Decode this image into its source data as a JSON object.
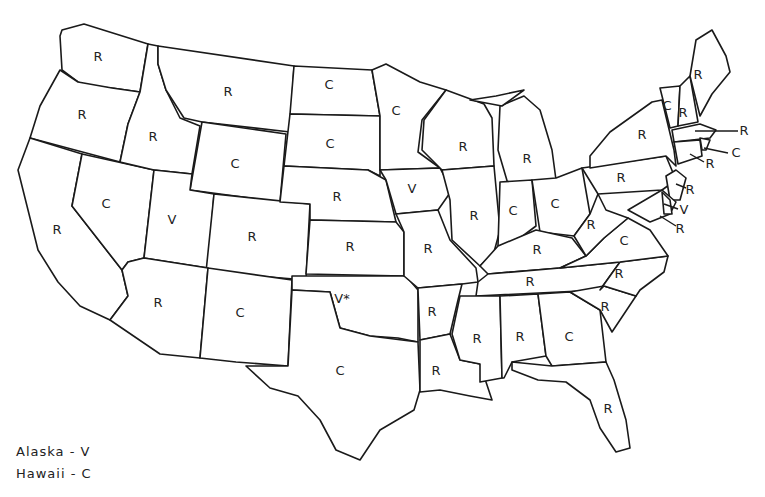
{
  "map": {
    "description": "US state outline map with single-letter codes per state",
    "codes_legend": [
      "R",
      "C",
      "V"
    ],
    "oklahoma_footnote_marker": "*"
  },
  "states": [
    {
      "name": "Washington",
      "code": "R",
      "x": 98,
      "y": 56
    },
    {
      "name": "Oregon",
      "code": "R",
      "x": 82,
      "y": 114
    },
    {
      "name": "California",
      "code": "R",
      "x": 57,
      "y": 229
    },
    {
      "name": "Idaho",
      "code": "R",
      "x": 153,
      "y": 136
    },
    {
      "name": "Nevada",
      "code": "C",
      "x": 106,
      "y": 203
    },
    {
      "name": "Montana",
      "code": "R",
      "x": 228,
      "y": 91
    },
    {
      "name": "Wyoming",
      "code": "C",
      "x": 235,
      "y": 163
    },
    {
      "name": "Utah",
      "code": "V",
      "x": 172,
      "y": 219
    },
    {
      "name": "Colorado",
      "code": "R",
      "x": 252,
      "y": 236
    },
    {
      "name": "Arizona",
      "code": "R",
      "x": 158,
      "y": 302
    },
    {
      "name": "New Mexico",
      "code": "C",
      "x": 240,
      "y": 312
    },
    {
      "name": "North Dakota",
      "code": "C",
      "x": 329,
      "y": 84
    },
    {
      "name": "South Dakota",
      "code": "C",
      "x": 330,
      "y": 143
    },
    {
      "name": "Nebraska",
      "code": "R",
      "x": 337,
      "y": 196
    },
    {
      "name": "Kansas",
      "code": "R",
      "x": 350,
      "y": 246
    },
    {
      "name": "Oklahoma",
      "code": "V*",
      "x": 342,
      "y": 298
    },
    {
      "name": "Texas",
      "code": "C",
      "x": 340,
      "y": 370
    },
    {
      "name": "Minnesota",
      "code": "C",
      "x": 396,
      "y": 110
    },
    {
      "name": "Iowa",
      "code": "V",
      "x": 412,
      "y": 188
    },
    {
      "name": "Missouri",
      "code": "R",
      "x": 428,
      "y": 248
    },
    {
      "name": "Arkansas",
      "code": "R",
      "x": 432,
      "y": 311
    },
    {
      "name": "Louisiana",
      "code": "R",
      "x": 436,
      "y": 370
    },
    {
      "name": "Wisconsin",
      "code": "R",
      "x": 463,
      "y": 146
    },
    {
      "name": "Illinois",
      "code": "R",
      "x": 474,
      "y": 215
    },
    {
      "name": "Michigan",
      "code": "R",
      "x": 527,
      "y": 158
    },
    {
      "name": "Indiana",
      "code": "C",
      "x": 513,
      "y": 210
    },
    {
      "name": "Ohio",
      "code": "C",
      "x": 555,
      "y": 203
    },
    {
      "name": "Kentucky",
      "code": "R",
      "x": 537,
      "y": 249
    },
    {
      "name": "Tennessee",
      "code": "R",
      "x": 530,
      "y": 281
    },
    {
      "name": "Mississippi",
      "code": "R",
      "x": 477,
      "y": 338
    },
    {
      "name": "Alabama",
      "code": "R",
      "x": 520,
      "y": 336
    },
    {
      "name": "Georgia",
      "code": "C",
      "x": 569,
      "y": 336
    },
    {
      "name": "Florida",
      "code": "R",
      "x": 608,
      "y": 408
    },
    {
      "name": "South Carolina",
      "code": "R",
      "x": 605,
      "y": 306
    },
    {
      "name": "North Carolina",
      "code": "R",
      "x": 619,
      "y": 273
    },
    {
      "name": "Virginia",
      "code": "C",
      "x": 624,
      "y": 240
    },
    {
      "name": "West Virginia",
      "code": "R",
      "x": 591,
      "y": 224
    },
    {
      "name": "Pennsylvania",
      "code": "R",
      "x": 621,
      "y": 177
    },
    {
      "name": "New York",
      "code": "R",
      "x": 642,
      "y": 134
    },
    {
      "name": "Vermont",
      "code": "C",
      "x": 667,
      "y": 105
    },
    {
      "name": "New Hampshire",
      "code": "R",
      "x": 683,
      "y": 112
    },
    {
      "name": "Maine",
      "code": "R",
      "x": 698,
      "y": 74
    },
    {
      "name": "Massachusetts",
      "code": "R",
      "x": 744,
      "y": 130
    },
    {
      "name": "Rhode Island",
      "code": "C",
      "x": 736,
      "y": 152
    },
    {
      "name": "Connecticut",
      "code": "R",
      "x": 710,
      "y": 163
    },
    {
      "name": "New Jersey",
      "code": "R",
      "x": 690,
      "y": 189
    },
    {
      "name": "Delaware",
      "code": "V",
      "x": 684,
      "y": 209
    },
    {
      "name": "Maryland",
      "code": "R",
      "x": 680,
      "y": 228
    }
  ],
  "legend": {
    "alaska": "Alaska - V",
    "hawaii": "Hawaii - C"
  }
}
